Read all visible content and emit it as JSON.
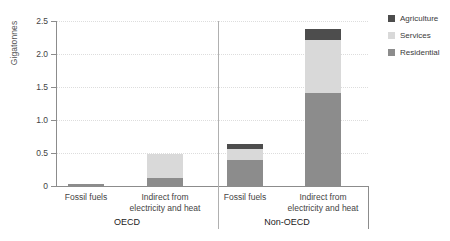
{
  "chart_data": {
    "type": "bar",
    "title": "",
    "subtitle": "",
    "xlabel": "",
    "ylabel": "Gigatonnes",
    "ylim": [
      0,
      2.5
    ],
    "yticks": [
      "0",
      "0.5",
      "1.0",
      "1.5",
      "2.0",
      "2.5"
    ],
    "ytick_values": [
      0,
      0.5,
      1.0,
      1.5,
      2.0,
      2.5
    ],
    "grid": true,
    "stacked": true,
    "legend_position": "right-top",
    "groups": [
      "OECD",
      "Non-OECD"
    ],
    "categories": [
      "Fossil fuels",
      "Indirect from electricity and heat",
      "Fossil fuels",
      "Indirect from electricity and heat"
    ],
    "series": [
      {
        "name": "Residential",
        "color": "#8c8c8c",
        "values": [
          0.03,
          0.12,
          0.4,
          1.41
        ]
      },
      {
        "name": "Services",
        "color": "#d9d9d9",
        "values": [
          0.0,
          0.36,
          0.16,
          0.81
        ]
      },
      {
        "name": "Agriculture",
        "color": "#4d4d4d",
        "values": [
          0.0,
          0.0,
          0.08,
          0.16
        ]
      }
    ],
    "totals": [
      0.03,
      0.48,
      0.64,
      2.38
    ]
  },
  "legend": {
    "items": [
      {
        "label": "Agriculture",
        "color": "#4d4d4d"
      },
      {
        "label": "Services",
        "color": "#d9d9d9"
      },
      {
        "label": "Residential",
        "color": "#8c8c8c"
      }
    ]
  },
  "axis": {
    "y_title": "Gigatonnes"
  },
  "x_axis": {
    "category_labels": [
      "Fossil fuels",
      "Indirect from\nelectricity and heat",
      "Fossil fuels",
      "Indirect from\nelectricity and heat"
    ],
    "group_labels": [
      "OECD",
      "Non-OECD"
    ]
  }
}
